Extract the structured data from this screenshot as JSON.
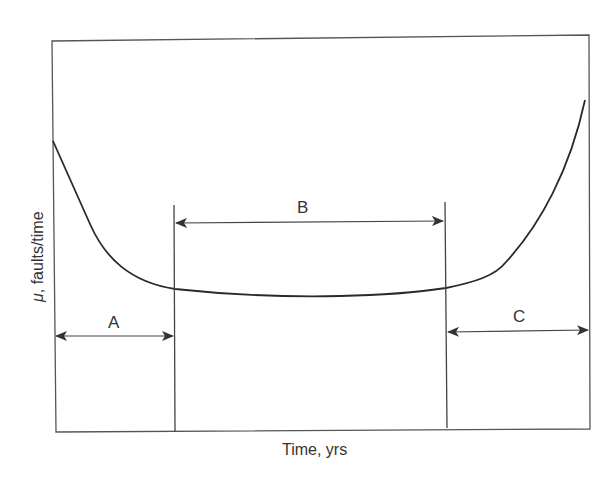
{
  "diagram": {
    "type": "bathtub-curve",
    "x_axis_label": "Time, yrs",
    "y_axis_label_symbol": "μ",
    "y_axis_label_text": ", faults/time",
    "regions": [
      {
        "id": "A",
        "label": "A"
      },
      {
        "id": "B",
        "label": "B"
      },
      {
        "id": "C",
        "label": "C"
      }
    ],
    "colors": {
      "line": "#2a2a2a",
      "frame": "#555555",
      "background": "#ffffff"
    }
  }
}
